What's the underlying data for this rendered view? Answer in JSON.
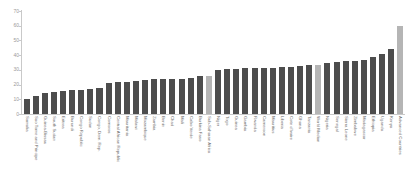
{
  "chart_data": {
    "type": "bar",
    "title": "",
    "subtitle": "",
    "xlabel": "",
    "ylabel": "",
    "ylim": [
      0,
      70
    ],
    "yticks": [
      0,
      10,
      20,
      30,
      40,
      50,
      60,
      70
    ],
    "grid": false,
    "legend": "none",
    "orientation": "vertical",
    "bar_color": "#4d4d4d",
    "highlight_color": "#b5b5b5",
    "axis_color": "#c9c9c9",
    "tick_label_color": "#9a9a9a",
    "category_label_color": "#6b6b6b",
    "categories": [
      "Somalia",
      "Sao Tome and Principe",
      "Guinea-Bissau",
      "South Sudan",
      "Eritrea",
      "Burundi",
      "Congo Republic",
      "Sudan",
      "Congo, Dem. Rep.",
      "Comoros",
      "Central African Republic",
      "Mauritania",
      "Malawi",
      "Mozambique",
      "Zambia",
      "Benin",
      "Chad",
      "Mali",
      "Cabo Verde",
      "Burkina Faso",
      "Sub-Saharan Africa",
      "Niger",
      "Togo",
      "Guinea",
      "Gambia",
      "Rwanda",
      "Cameroon",
      "Mauritius",
      "Liberia",
      "Cote d'Ivoire",
      "Ghana",
      "Tanzania",
      "World Median",
      "Nigeria",
      "Senegal",
      "Sierra Leone",
      "Zimbabwe",
      "Madagascar",
      "Ethiopia",
      "Uganda",
      "Kenya",
      "Advanced Countries"
    ],
    "values": [
      10.5,
      12.5,
      14.0,
      15.0,
      15.5,
      16.0,
      16.5,
      17.0,
      18.0,
      21.0,
      21.5,
      22.0,
      22.5,
      23.0,
      23.5,
      23.5,
      24.0,
      24.0,
      24.5,
      25.5,
      26.0,
      30.0,
      30.5,
      30.5,
      31.0,
      31.0,
      31.5,
      31.5,
      32.0,
      32.0,
      32.5,
      33.0,
      33.5,
      35.0,
      35.5,
      36.0,
      36.0,
      37.0,
      38.5,
      41.0,
      44.0,
      60.0
    ],
    "highlighted": [
      "Sub-Saharan Africa",
      "World Median",
      "Advanced Countries"
    ]
  }
}
